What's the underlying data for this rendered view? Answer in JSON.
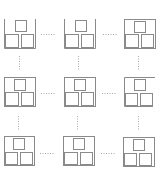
{
  "diagram": {
    "type": "3x3 grid of box-packing states",
    "stroke_color": "#8a8a8a",
    "connector_color": "#a8a8a8",
    "cells": [
      {
        "row": 0,
        "col": 0,
        "container": "open-top"
      },
      {
        "row": 0,
        "col": 1,
        "container": "open-top"
      },
      {
        "row": 0,
        "col": 2,
        "container": "closed"
      },
      {
        "row": 1,
        "col": 0,
        "container": "closed"
      },
      {
        "row": 1,
        "col": 1,
        "container": "closed"
      },
      {
        "row": 1,
        "col": 2,
        "container": "open-right"
      },
      {
        "row": 2,
        "col": 0,
        "container": "closed"
      },
      {
        "row": 2,
        "col": 1,
        "container": "closed"
      },
      {
        "row": 2,
        "col": 2,
        "container": "closed"
      }
    ],
    "inner_boxes_per_cell": 3
  }
}
